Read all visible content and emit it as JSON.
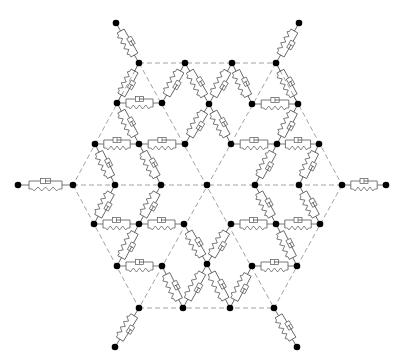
{
  "diagram": {
    "title": "",
    "colors": {
      "node": "#000000",
      "lattice": "#8a8a8a",
      "element": "#555555",
      "background": "#ffffff"
    },
    "nodes": [
      {
        "id": "n1",
        "x": 116,
        "y": 23
      },
      {
        "id": "n2",
        "x": 299,
        "y": 23
      },
      {
        "id": "n3",
        "x": 139,
        "y": 63
      },
      {
        "id": "n4",
        "x": 185,
        "y": 63
      },
      {
        "id": "n5",
        "x": 232,
        "y": 63
      },
      {
        "id": "n6",
        "x": 276,
        "y": 63
      },
      {
        "id": "n7",
        "x": 117,
        "y": 103
      },
      {
        "id": "n8",
        "x": 162,
        "y": 103
      },
      {
        "id": "n9",
        "x": 209,
        "y": 104
      },
      {
        "id": "n10",
        "x": 252,
        "y": 104
      },
      {
        "id": "n11",
        "x": 298,
        "y": 104
      },
      {
        "id": "n12",
        "x": 95,
        "y": 144
      },
      {
        "id": "n13",
        "x": 139,
        "y": 144
      },
      {
        "id": "n14",
        "x": 185,
        "y": 144
      },
      {
        "id": "n15",
        "x": 231,
        "y": 144
      },
      {
        "id": "n16",
        "x": 277,
        "y": 144
      },
      {
        "id": "n17",
        "x": 319,
        "y": 144
      },
      {
        "id": "n18",
        "x": 18,
        "y": 185
      },
      {
        "id": "n19",
        "x": 73,
        "y": 185
      },
      {
        "id": "n20",
        "x": 115,
        "y": 185
      },
      {
        "id": "n21",
        "x": 161,
        "y": 185
      },
      {
        "id": "n22",
        "x": 207,
        "y": 185
      },
      {
        "id": "n23",
        "x": 255,
        "y": 185
      },
      {
        "id": "n24",
        "x": 299,
        "y": 185
      },
      {
        "id": "n25",
        "x": 342,
        "y": 185
      },
      {
        "id": "n26",
        "x": 386,
        "y": 185
      },
      {
        "id": "n27",
        "x": 94,
        "y": 224
      },
      {
        "id": "n28",
        "x": 139,
        "y": 224
      },
      {
        "id": "n29",
        "x": 184,
        "y": 224
      },
      {
        "id": "n30",
        "x": 231,
        "y": 224
      },
      {
        "id": "n31",
        "x": 276,
        "y": 224
      },
      {
        "id": "n32",
        "x": 320,
        "y": 224
      },
      {
        "id": "n33",
        "x": 117,
        "y": 266
      },
      {
        "id": "n34",
        "x": 162,
        "y": 266
      },
      {
        "id": "n35",
        "x": 207,
        "y": 264
      },
      {
        "id": "n36",
        "x": 252,
        "y": 266
      },
      {
        "id": "n37",
        "x": 297,
        "y": 266
      },
      {
        "id": "n38",
        "x": 139,
        "y": 308
      },
      {
        "id": "n39",
        "x": 183,
        "y": 308
      },
      {
        "id": "n40",
        "x": 230,
        "y": 308
      },
      {
        "id": "n41",
        "x": 274,
        "y": 308
      },
      {
        "id": "n42",
        "x": 115,
        "y": 347
      },
      {
        "id": "n43",
        "x": 297,
        "y": 347
      }
    ],
    "lattice_lines": [
      [
        139,
        63,
        276,
        63
      ],
      [
        73,
        185,
        342,
        185
      ],
      [
        139,
        308,
        274,
        308
      ],
      [
        139,
        63,
        274,
        308
      ],
      [
        73,
        185,
        139,
        308
      ],
      [
        276,
        63,
        342,
        185
      ],
      [
        276,
        63,
        139,
        308
      ],
      [
        139,
        63,
        73,
        185
      ],
      [
        342,
        185,
        274,
        308
      ]
    ],
    "elements": [
      [
        116,
        23,
        139,
        63
      ],
      [
        299,
        23,
        276,
        63
      ],
      [
        18,
        185,
        73,
        185
      ],
      [
        342,
        185,
        386,
        185
      ],
      [
        139,
        308,
        115,
        347
      ],
      [
        274,
        308,
        297,
        347
      ],
      [
        139,
        63,
        117,
        103
      ],
      [
        185,
        63,
        162,
        103
      ],
      [
        185,
        63,
        209,
        104
      ],
      [
        232,
        63,
        209,
        104
      ],
      [
        232,
        63,
        252,
        104
      ],
      [
        276,
        63,
        298,
        104
      ],
      [
        117,
        103,
        162,
        103
      ],
      [
        252,
        104,
        298,
        104
      ],
      [
        117,
        103,
        139,
        144
      ],
      [
        209,
        104,
        185,
        144
      ],
      [
        209,
        104,
        231,
        144
      ],
      [
        298,
        104,
        277,
        144
      ],
      [
        95,
        144,
        139,
        144
      ],
      [
        139,
        144,
        185,
        144
      ],
      [
        231,
        144,
        277,
        144
      ],
      [
        277,
        144,
        319,
        144
      ],
      [
        95,
        144,
        115,
        185
      ],
      [
        139,
        144,
        161,
        185
      ],
      [
        277,
        144,
        255,
        185
      ],
      [
        319,
        144,
        299,
        185
      ],
      [
        115,
        185,
        94,
        224
      ],
      [
        161,
        185,
        139,
        224
      ],
      [
        255,
        185,
        276,
        224
      ],
      [
        299,
        185,
        320,
        224
      ],
      [
        94,
        224,
        139,
        224
      ],
      [
        139,
        224,
        184,
        224
      ],
      [
        231,
        224,
        276,
        224
      ],
      [
        276,
        224,
        320,
        224
      ],
      [
        139,
        224,
        117,
        266
      ],
      [
        184,
        224,
        207,
        264
      ],
      [
        231,
        224,
        207,
        264
      ],
      [
        276,
        224,
        297,
        266
      ],
      [
        117,
        266,
        162,
        266
      ],
      [
        252,
        266,
        297,
        266
      ],
      [
        162,
        266,
        183,
        308
      ],
      [
        207,
        264,
        183,
        308
      ],
      [
        207,
        264,
        230,
        308
      ],
      [
        252,
        266,
        230,
        308
      ]
    ]
  }
}
